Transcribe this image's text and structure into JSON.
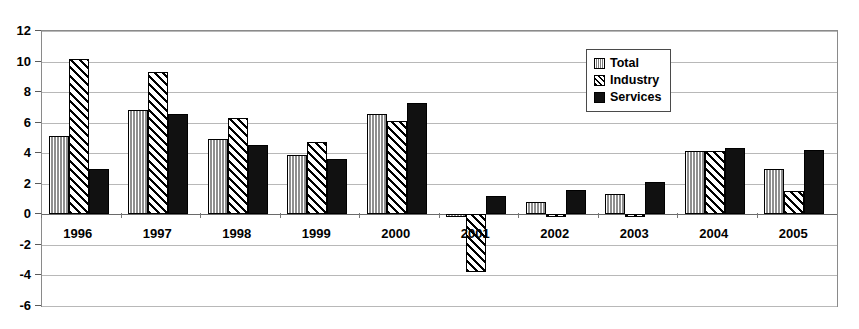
{
  "chart_data": {
    "type": "bar",
    "title": "",
    "subtitle": "",
    "xlabel": "",
    "ylabel": "",
    "ylim": [
      -6,
      12
    ],
    "yticks": [
      12,
      10,
      8,
      6,
      4,
      2,
      0,
      -2,
      -4,
      -6
    ],
    "ytick_labels": [
      "12",
      "10",
      "8",
      "6",
      "4",
      "2",
      "0",
      "-2",
      "-4",
      "-6"
    ],
    "grid": true,
    "grid_axis": "y",
    "legend_position": "top-right",
    "categories": [
      "1996",
      "1997",
      "1998",
      "1999",
      "2000",
      "2001",
      "2002",
      "2003",
      "2004",
      "2005"
    ],
    "series": [
      {
        "name": "Total",
        "pattern": "vertical-stripes",
        "color": "#b5b5b5",
        "values": [
          5.1,
          6.8,
          4.9,
          3.9,
          6.6,
          -0.15,
          0.8,
          1.35,
          4.15,
          3.0
        ]
      },
      {
        "name": "Industry",
        "pattern": "diagonal-hatch",
        "color": "#ffffff",
        "values": [
          10.2,
          9.3,
          6.3,
          4.75,
          6.1,
          -3.8,
          -0.1,
          -0.2,
          4.15,
          1.5
        ]
      },
      {
        "name": "Services",
        "pattern": "solid",
        "color": "#111111",
        "values": [
          3.0,
          6.6,
          4.55,
          3.6,
          7.3,
          1.2,
          1.6,
          2.1,
          4.35,
          4.2
        ]
      }
    ]
  },
  "legend": {
    "items": [
      {
        "label": "Total"
      },
      {
        "label": "Industry"
      },
      {
        "label": "Services"
      }
    ]
  }
}
